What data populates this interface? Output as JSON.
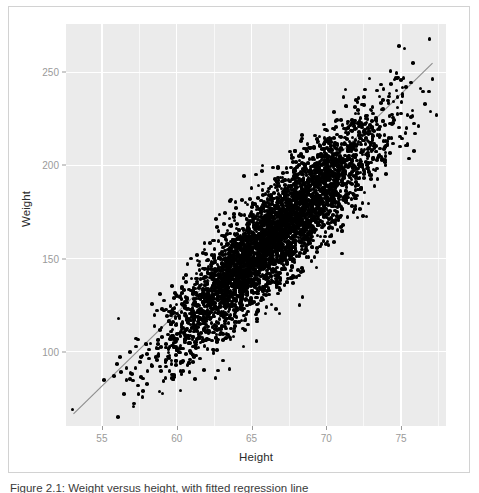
{
  "figure": {
    "caption": "Figure 2.1: Weight versus height, with fitted regression line",
    "panel_background": "#ebebeb",
    "grid_color": "#ffffff",
    "point_color": "#000000",
    "trend_color": "#8c8c8c",
    "frame_color": "#d2d2d2"
  },
  "chart_data": {
    "type": "scatter",
    "title": "",
    "xlabel": "Height",
    "ylabel": "Weight",
    "xlim": [
      52.6,
      78.0
    ],
    "ylim": [
      60,
      276
    ],
    "xticks": [
      55,
      60,
      65,
      70,
      75
    ],
    "yticks": [
      100,
      150,
      200,
      250
    ],
    "xtick_labels": [
      "55",
      "60",
      "65",
      "70",
      "75"
    ],
    "ytick_labels": [
      "100",
      "150",
      "200",
      "250"
    ],
    "grid": true,
    "minor_grid": true,
    "legend": "none",
    "n_points": 4200,
    "marker": "filled-circle",
    "marker_size": 3.6,
    "correlation": 0.9,
    "distribution": {
      "x_mean": 66.4,
      "x_sd": 3.6,
      "y_mean": 161.0,
      "y_sd": 31.5
    },
    "trend_line": {
      "type": "linear-fit",
      "x": [
        53.1,
        77.1
      ],
      "y": [
        66.5,
        255.0
      ],
      "slope": 7.85,
      "intercept": -350.3,
      "color": "#8c8c8c",
      "width": 1.1
    },
    "outliers": [
      {
        "x": 76.9,
        "y": 268.0
      }
    ],
    "series": [
      {
        "name": "observations",
        "color": "#000000"
      }
    ]
  }
}
